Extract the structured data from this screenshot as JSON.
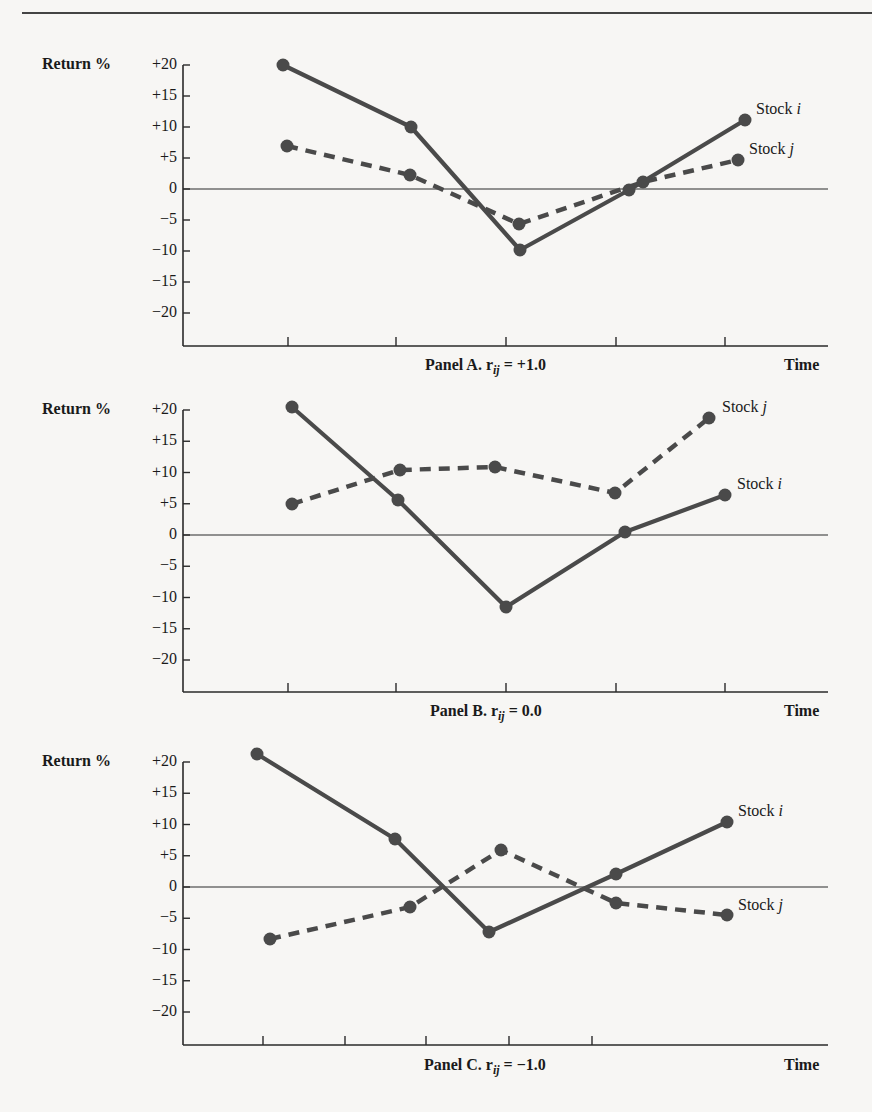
{
  "chart_data": [
    {
      "type": "line",
      "title": "Panel A. r_ij = +1.0",
      "caption_prefix": "Panel A. r",
      "caption_sub": "ij",
      "caption_suffix": " = +1.0",
      "xlabel": "Time",
      "ylabel": "Return %",
      "ylim": [
        -25,
        20
      ],
      "yticks": [
        "+20",
        "+15",
        "+10",
        "+5",
        "0",
        "−5",
        "−10",
        "−15",
        "−20"
      ],
      "ytick_values": [
        20,
        15,
        10,
        5,
        0,
        -5,
        -10,
        -15,
        -20
      ],
      "x": [
        1,
        2,
        3,
        4,
        5
      ],
      "grid": false,
      "legend_position": "end-of-line labels",
      "series": [
        {
          "name": "Stock i",
          "style": "solid",
          "values": [
            20,
            10,
            -10,
            0,
            11
          ]
        },
        {
          "name": "Stock j",
          "style": "dashed",
          "values": [
            7,
            2.5,
            -5.5,
            1,
            5
          ]
        }
      ]
    },
    {
      "type": "line",
      "title": "Panel B. r_ij = 0.0",
      "caption_prefix": "Panel B. r",
      "caption_sub": "ij",
      "caption_suffix": " = 0.0",
      "xlabel": "Time",
      "ylabel": "Return %",
      "ylim": [
        -25,
        20
      ],
      "yticks": [
        "+20",
        "+15",
        "+10",
        "+5",
        "0",
        "−5",
        "−10",
        "−15",
        "−20"
      ],
      "ytick_values": [
        20,
        15,
        10,
        5,
        0,
        -5,
        -10,
        -15,
        -20
      ],
      "x": [
        1,
        2,
        3,
        4,
        5
      ],
      "grid": false,
      "legend_position": "end-of-line labels",
      "series": [
        {
          "name": "Stock i",
          "style": "solid",
          "values": [
            20.5,
            5.5,
            -11.5,
            0.5,
            6.5
          ]
        },
        {
          "name": "Stock j",
          "style": "dashed",
          "values": [
            5,
            10.5,
            11,
            7,
            19
          ]
        }
      ]
    },
    {
      "type": "line",
      "title": "Panel C. r_ij = -1.0",
      "caption_prefix": "Panel C. r",
      "caption_sub": "ij",
      "caption_suffix": " = −1.0",
      "xlabel": "Time",
      "ylabel": "Return %",
      "ylim": [
        -25,
        20
      ],
      "yticks": [
        "+20",
        "+15",
        "+10",
        "+5",
        "0",
        "−5",
        "−10",
        "−15",
        "−20"
      ],
      "ytick_values": [
        20,
        15,
        10,
        5,
        0,
        -5,
        -10,
        -15,
        -20
      ],
      "x": [
        1,
        2,
        3,
        4,
        5
      ],
      "grid": false,
      "legend_position": "end-of-line labels",
      "series": [
        {
          "name": "Stock i",
          "style": "solid",
          "values": [
            21.5,
            7.5,
            -7.5,
            2,
            10.5
          ]
        },
        {
          "name": "Stock j",
          "style": "dashed",
          "values": [
            -8.5,
            -3.5,
            6,
            -2.5,
            -4.5
          ]
        }
      ]
    }
  ],
  "panels": [
    {
      "top": 50,
      "zero_y": 139,
      "px_per_unit": 6.2,
      "baseline_y": 296,
      "xticks_px": [
        288,
        396,
        506,
        616,
        725
      ],
      "points_px": {
        "i": [
          [
            283,
            15
          ],
          [
            411,
            77
          ],
          [
            520,
            200
          ],
          [
            629,
            140
          ],
          [
            745,
            70
          ]
        ],
        "j": [
          [
            287,
            96
          ],
          [
            410,
            125
          ],
          [
            519,
            174
          ],
          [
            643,
            132
          ],
          [
            738,
            110
          ]
        ]
      },
      "label_i": {
        "x": 756,
        "y": 60,
        "name": "Stock ",
        "var": "i"
      },
      "label_j": {
        "x": 749,
        "y": 100,
        "name": "Stock ",
        "var": "j"
      },
      "caption_x": 425,
      "caption_y": 306
    },
    {
      "top": 398,
      "zero_y": 137,
      "px_per_unit": 6.25,
      "baseline_y": 294,
      "xticks_px": [
        288,
        396,
        506,
        616,
        725
      ],
      "points_px": {
        "i": [
          [
            292,
            9
          ],
          [
            398,
            102
          ],
          [
            506,
            209
          ],
          [
            625,
            134
          ],
          [
            725,
            97
          ]
        ],
        "j": [
          [
            292,
            106
          ],
          [
            400,
            72
          ],
          [
            495,
            69
          ],
          [
            615,
            95
          ],
          [
            709,
            20
          ]
        ]
      },
      "label_i": {
        "x": 737,
        "y": 87,
        "name": "Stock ",
        "var": "i"
      },
      "label_j": {
        "x": 722,
        "y": 10,
        "name": "Stock ",
        "var": "j"
      },
      "caption_x": 430,
      "caption_y": 304
    },
    {
      "top": 746,
      "zero_y": 141,
      "px_per_unit": 6.25,
      "baseline_y": 299,
      "xticks_px": [
        263,
        345,
        426,
        509,
        592
      ],
      "points_px": {
        "i": [
          [
            257,
            8
          ],
          [
            395,
            93
          ],
          [
            489,
            186
          ],
          [
            616,
            128
          ],
          [
            727,
            76
          ]
        ],
        "j": [
          [
            270,
            193
          ],
          [
            410,
            161
          ],
          [
            501,
            104
          ],
          [
            616,
            157
          ],
          [
            727,
            169
          ]
        ]
      },
      "label_i": {
        "x": 738,
        "y": 66,
        "name": "Stock ",
        "var": "i"
      },
      "label_j": {
        "x": 738,
        "y": 160,
        "name": "Stock ",
        "var": "j"
      },
      "caption_x": 424,
      "caption_y": 310
    }
  ],
  "colors": {
    "line": "#4a4a4a",
    "axis": "#2a2a2a",
    "text": "#1a1a1a",
    "background": "#f7f6f4"
  }
}
